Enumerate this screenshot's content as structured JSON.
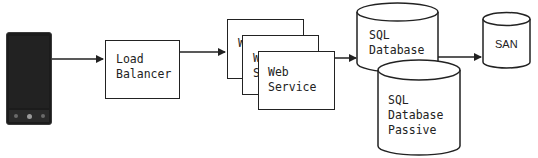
{
  "diagram": {
    "title": "",
    "nodes": {
      "client": {
        "type": "mobile-phone",
        "label": ""
      },
      "load_balancer": {
        "line1": "Load",
        "line2": "Balancer"
      },
      "web_service_1": {
        "line1": "W",
        "line2": ""
      },
      "web_service_2": {
        "line1": "W",
        "line2": "S"
      },
      "web_service_3": {
        "line1": "Web",
        "line2": "Service"
      },
      "sql_primary": {
        "line1": "SQL",
        "line2": "Database"
      },
      "sql_passive": {
        "line1": "SQL",
        "line2": "Database",
        "line3": "Passive"
      },
      "san": {
        "label": "SAN"
      }
    },
    "edges": [
      {
        "from": "client",
        "to": "load_balancer"
      },
      {
        "from": "load_balancer",
        "to": "web_service_1"
      },
      {
        "from": "web_service_3",
        "to": "sql_primary"
      },
      {
        "from": "sql_primary",
        "to": "san"
      }
    ],
    "colors": {
      "stroke": "#222222",
      "background": "#ffffff",
      "phone": "#1c1c1c"
    }
  }
}
